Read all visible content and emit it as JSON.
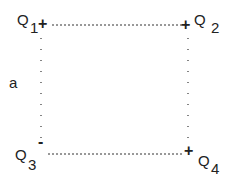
{
  "diagram": {
    "charges": [
      {
        "name": "Q",
        "sub": "1",
        "sign": "+"
      },
      {
        "name": "Q",
        "sub": "2",
        "sign": "+"
      },
      {
        "name": "Q",
        "sub": "3",
        "sign": "-"
      },
      {
        "name": "Q",
        "sub": "4",
        "sign": "+"
      }
    ],
    "side_label": "a",
    "line_color": "#333333"
  }
}
